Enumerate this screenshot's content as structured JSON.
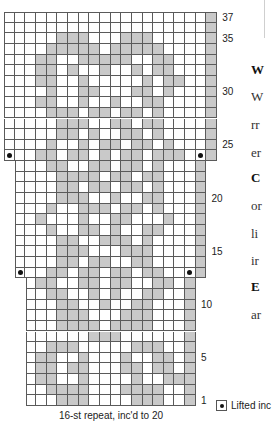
{
  "chart": {
    "title": "",
    "caption": "16-st repeat, inc'd to 20",
    "legend": [
      {
        "symbol": "dot",
        "label": "Lifted inc"
      }
    ],
    "row_labels": [
      "1",
      "5",
      "10",
      "15",
      "20",
      "25",
      "30",
      "35",
      "37"
    ],
    "colors": {
      "contrast": "#c9c9c9",
      "background": "#ffffff",
      "grid": "#5a5a5a",
      "dot": "#111111"
    }
  },
  "chart_data": {
    "type": "table",
    "xlabel": "16-st repeat, inc'd to 20",
    "ylabel": "Rows",
    "rows_total": 37,
    "row_tick_labels": [
      1,
      5,
      10,
      15,
      20,
      25,
      30,
      35,
      37
    ],
    "legend": [
      "Lifted inc"
    ],
    "sections": [
      {
        "rows": "1-12",
        "stitches": 16
      },
      {
        "rows": "13-23",
        "stitches": 18,
        "increase_row": 13
      },
      {
        "rows": "24-37",
        "stitches": 20,
        "increase_row": 24
      }
    ],
    "grid_rows_top_to_bottom": [
      {
        "row": 37,
        "offset": 0,
        "cells": "...................X",
        "dots": []
      },
      {
        "row": 36,
        "offset": 0,
        "cells": "...................X",
        "dots": []
      },
      {
        "row": 35,
        "offset": 0,
        "cells": ".....XXX...XXX.....X",
        "dots": []
      },
      {
        "row": 34,
        "offset": 0,
        "cells": "....XXXXX.XXXXX....X",
        "dots": []
      },
      {
        "row": 33,
        "offset": 0,
        "cells": "...XX..XXXXX..XX...X",
        "dots": []
      },
      {
        "row": 32,
        "offset": 0,
        "cells": "...XX.X..X..X.XX...X",
        "dots": []
      },
      {
        "row": 31,
        "offset": 0,
        "cells": "...XX..X.....X.XX..X",
        "dots": []
      },
      {
        "row": 30,
        "offset": 0,
        "cells": "....X..XX...XX.X...X",
        "dots": []
      },
      {
        "row": 29,
        "offset": 0,
        "cells": "...XX..X..X..XX....X",
        "dots": []
      },
      {
        "row": 28,
        "offset": 0,
        "cells": "....XXX.XX.XX.X....X",
        "dots": []
      },
      {
        "row": 27,
        "offset": 0,
        "cells": ".....XXX..XX.XX....X",
        "dots": []
      },
      {
        "row": 26,
        "offset": 0,
        "cells": ".....XX.X..XX.X....X",
        "dots": []
      },
      {
        "row": 25,
        "offset": 0,
        "cells": "....X..X.XX.XX.X...X",
        "dots": []
      },
      {
        "row": 24,
        "offset": 0,
        "cells": "...XX.XX.X.XX.XXX..X",
        "dots": [
          0,
          18
        ]
      },
      {
        "row": 23,
        "offset": 1,
        "cells": "...XX..XX.XX.X...X",
        "dots": []
      },
      {
        "row": 22,
        "offset": 1,
        "cells": "....XXXX.XX.XX...X",
        "dots": []
      },
      {
        "row": 21,
        "offset": 1,
        "cells": "....XX.XX.XX.X...X",
        "dots": []
      },
      {
        "row": 20,
        "offset": 1,
        "cells": "....XXX..X..XX...X",
        "dots": []
      },
      {
        "row": 19,
        "offset": 1,
        "cells": "...X..XXX.XX.X...X",
        "dots": []
      },
      {
        "row": 18,
        "offset": 1,
        "cells": "..X...X..XX...X..X",
        "dots": []
      },
      {
        "row": 17,
        "offset": 1,
        "cells": "...X..XX.X..XX...X",
        "dots": []
      },
      {
        "row": 16,
        "offset": 1,
        "cells": "....XX..XXX.X....X",
        "dots": []
      },
      {
        "row": 15,
        "offset": 1,
        "cells": "....XXX...XXX....X",
        "dots": []
      },
      {
        "row": 14,
        "offset": 1,
        "cells": "....XX.XX..XX....X",
        "dots": []
      },
      {
        "row": 13,
        "offset": 1,
        "cells": "...XX.XX.XX.XX...X",
        "dots": [
          0,
          16
        ]
      },
      {
        "row": 12,
        "offset": 2,
        "cells": ".XX..XX.XX..XX.X",
        "dots": []
      },
      {
        "row": 11,
        "offset": 2,
        "cells": "..XX..X.X..XX..X",
        "dots": []
      },
      {
        "row": 10,
        "offset": 2,
        "cells": "...XX..X..XX...X",
        "dots": []
      },
      {
        "row": 9,
        "offset": 2,
        "cells": "...XXX...XXX...X",
        "dots": []
      },
      {
        "row": 8,
        "offset": 2,
        "cells": "...XXXX.XXXX...X",
        "dots": []
      },
      {
        "row": 7,
        "offset": 2,
        "cells": "......XXX......X",
        "dots": []
      },
      {
        "row": 6,
        "offset": 2,
        "cells": "..XXX.....XXX..X",
        "dots": []
      },
      {
        "row": 5,
        "offset": 2,
        "cells": ".XX..X...X..XX.X",
        "dots": []
      },
      {
        "row": 4,
        "offset": 2,
        "cells": ".XX.XX...XX.XX.X",
        "dots": []
      },
      {
        "row": 3,
        "offset": 2,
        "cells": ".XX..X....X..XXX",
        "dots": []
      },
      {
        "row": 2,
        "offset": 2,
        "cells": "..XXXX...XXXX..X",
        "dots": []
      },
      {
        "row": 1,
        "offset": 2,
        "cells": "...XXX....XXX..X",
        "dots": []
      }
    ]
  },
  "sidepanel": {
    "lines": [
      {
        "text": "W",
        "bold": true,
        "top": 62
      },
      {
        "text": "W",
        "bold": false,
        "top": 89
      },
      {
        "text": "rr",
        "bold": false,
        "top": 117
      },
      {
        "text": "er",
        "bold": false,
        "top": 145
      },
      {
        "text": "C",
        "bold": true,
        "top": 170
      },
      {
        "text": "or",
        "bold": false,
        "top": 198
      },
      {
        "text": "li",
        "bold": false,
        "top": 226
      },
      {
        "text": "ir",
        "bold": false,
        "top": 253
      },
      {
        "text": "E",
        "bold": true,
        "top": 279
      },
      {
        "text": "ar",
        "bold": false,
        "top": 307
      }
    ]
  }
}
